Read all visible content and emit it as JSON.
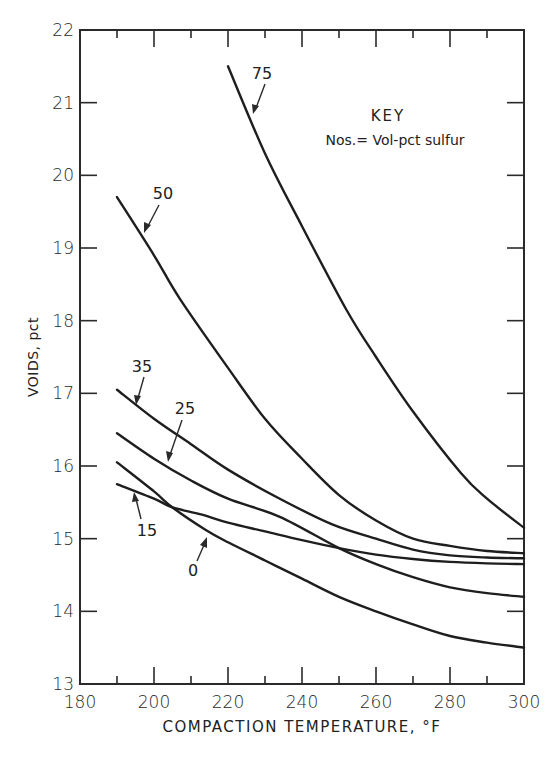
{
  "chart_data": {
    "type": "line",
    "title": "",
    "xlabel": "COMPACTION TEMPERATURE, °F",
    "ylabel": "VOIDS, pct",
    "xlim": [
      180,
      300
    ],
    "ylim": [
      13,
      22
    ],
    "x_ticks": [
      180,
      200,
      220,
      240,
      260,
      280,
      300
    ],
    "x_minor_ticks": [
      190,
      210,
      230,
      250,
      270,
      290
    ],
    "y_ticks": [
      13,
      14,
      15,
      16,
      17,
      18,
      19,
      20,
      21,
      22
    ],
    "grid": false,
    "legend": {
      "title": "KEY",
      "text": "Nos.= Vol-pct sulfur",
      "position": "upper right"
    },
    "series": [
      {
        "name": "75",
        "x": [
          220,
          230,
          240,
          252,
          260,
          270,
          283,
          290,
          300
        ],
        "values": [
          21.5,
          20.3,
          19.3,
          18.15,
          17.5,
          16.75,
          15.9,
          15.55,
          15.15
        ]
      },
      {
        "name": "50",
        "x": [
          190,
          200,
          207,
          220,
          230,
          240,
          250,
          260,
          270,
          280,
          290,
          300
        ],
        "values": [
          19.7,
          18.9,
          18.3,
          17.35,
          16.65,
          16.1,
          15.6,
          15.25,
          15.0,
          14.9,
          14.83,
          14.8
        ]
      },
      {
        "name": "35",
        "x": [
          190,
          200,
          210,
          220,
          234,
          248,
          260,
          270,
          280,
          290,
          300
        ],
        "values": [
          17.05,
          16.65,
          16.3,
          15.95,
          15.55,
          15.2,
          15.0,
          14.85,
          14.77,
          14.74,
          14.73
        ]
      },
      {
        "name": "25",
        "x": [
          190,
          200,
          210,
          220,
          234,
          250,
          260,
          270,
          280,
          290,
          300
        ],
        "values": [
          16.45,
          16.1,
          15.8,
          15.55,
          15.3,
          14.87,
          14.65,
          14.47,
          14.33,
          14.25,
          14.2
        ]
      },
      {
        "name": "15",
        "x": [
          190,
          200,
          205,
          213,
          220,
          230,
          240,
          250,
          260,
          270,
          280,
          290,
          300
        ],
        "values": [
          15.75,
          15.55,
          15.43,
          15.33,
          15.22,
          15.1,
          14.98,
          14.87,
          14.78,
          14.72,
          14.68,
          14.66,
          14.65
        ]
      },
      {
        "name": "0",
        "x": [
          190,
          200,
          205,
          214,
          220,
          230,
          240,
          250,
          260,
          270,
          280,
          290,
          300
        ],
        "values": [
          16.05,
          15.65,
          15.43,
          15.12,
          14.95,
          14.7,
          14.45,
          14.2,
          14.0,
          13.82,
          13.66,
          13.57,
          13.5
        ]
      }
    ]
  },
  "labels": {
    "x_axis_title": "COMPACTION TEMPERATURE, °F",
    "y_axis_title": "VOIDS, pct",
    "key_title": "KEY",
    "key_text": "Nos.= Vol-pct sulfur",
    "x_tick_labels": [
      "180",
      "200",
      "220",
      "240",
      "260",
      "280",
      "300"
    ],
    "y_tick_labels": [
      "13",
      "14",
      "15",
      "16",
      "17",
      "18",
      "19",
      "20",
      "21",
      "22"
    ],
    "curve_labels": [
      "75",
      "50",
      "35",
      "25",
      "15",
      "0"
    ]
  }
}
